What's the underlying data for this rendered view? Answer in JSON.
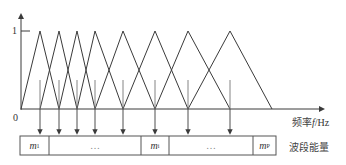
{
  "diagram": {
    "y_axis": {
      "tick_label": "1",
      "origin_label": "0"
    },
    "x_axis": {
      "label_cjk": "频率",
      "label_var": "f",
      "label_unit": "/Hz"
    },
    "filters": {
      "count": 8,
      "peak_x": [
        40,
        59,
        77,
        95,
        123,
        155,
        188,
        230
      ],
      "left_base_x": [
        21,
        40,
        59,
        77,
        95,
        123,
        155,
        188
      ],
      "right_base_x": [
        59,
        77,
        95,
        123,
        155,
        188,
        230,
        272
      ]
    },
    "band_energy": {
      "label": "波段能量",
      "cells": [
        {
          "label": "m",
          "sub": "1"
        },
        {
          "label": "…",
          "sub": ""
        },
        {
          "label": "m",
          "sub": "i"
        },
        {
          "label": "…",
          "sub": ""
        },
        {
          "label": "m",
          "sub": "P"
        }
      ]
    },
    "colors": {
      "line": "#3a3a3a",
      "box": "#555555",
      "text": "#333333"
    }
  }
}
